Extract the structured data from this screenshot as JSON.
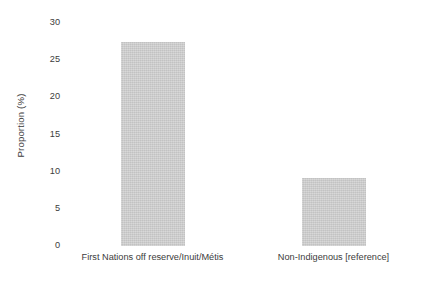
{
  "chart_data": {
    "type": "bar",
    "title": "",
    "xlabel": "",
    "ylabel": "Proportion (%)",
    "categories": [
      "First Nations off reserve/Inuit/Métis",
      "Non-Indigenous [reference]"
    ],
    "values": [
      27.5,
      9.1
    ],
    "ylim": [
      0,
      30
    ],
    "yticks": [
      0,
      5,
      10,
      15,
      20,
      25,
      30
    ],
    "ytick_labels": [
      "0",
      "5",
      "10",
      "15",
      "20",
      "25",
      "30"
    ],
    "grid": false,
    "legend": null,
    "bar_color": "#c9c9c9",
    "text_color": "#3c3c3c",
    "background_color": "#ffffff"
  },
  "axes": {
    "y_title": "Proportion (%)"
  }
}
